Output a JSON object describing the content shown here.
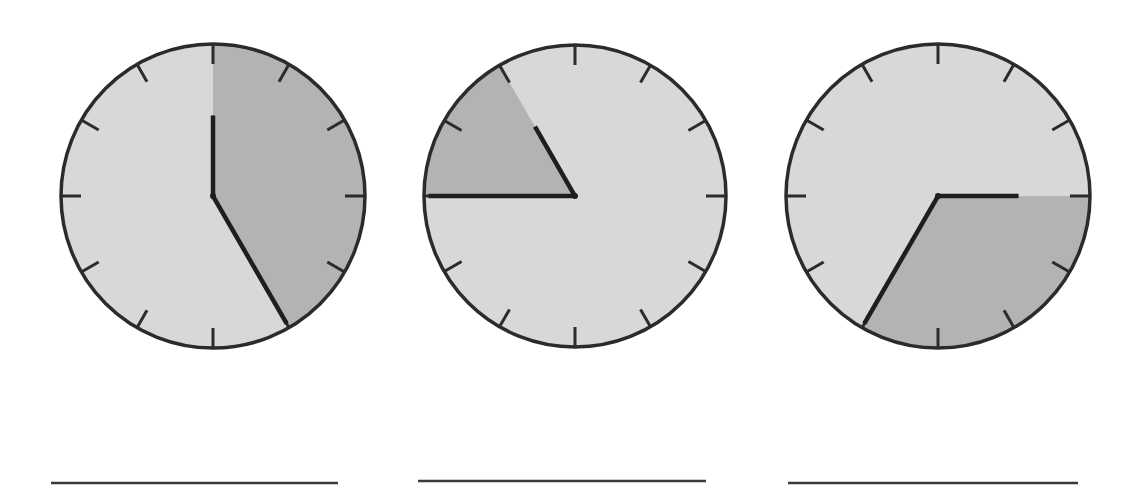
{
  "worksheet": {
    "type": "clock-reading exercise",
    "colors": {
      "face": "#d8d8d8",
      "shaded_sector": "#b3b3b3",
      "outline": "#2b2b2b",
      "hands": "#1e1e1e",
      "answer_line": "#3a3a3a"
    },
    "clocks": [
      {
        "id": "clock-1",
        "cx": 213,
        "cy": 196,
        "r": 152,
        "hour_hand_points_to": 12,
        "minute_hand_points_to": 5,
        "time_shown": "12:25",
        "shaded_from": 12,
        "shaded_to": 5,
        "answer_line": {
          "x1": 51,
          "x2": 338,
          "y": 483
        }
      },
      {
        "id": "clock-2",
        "cx": 575,
        "cy": 196,
        "r": 151,
        "hour_hand_points_to": 11,
        "minute_hand_points_to": 9,
        "time_shown": "10:45",
        "shaded_from": 9,
        "shaded_to": 11,
        "answer_line": {
          "x1": 418,
          "x2": 706,
          "y": 481
        }
      },
      {
        "id": "clock-3",
        "cx": 938,
        "cy": 196,
        "r": 152,
        "hour_hand_points_to": 3,
        "minute_hand_points_to": 7,
        "time_shown": "3:35",
        "shaded_from": 3,
        "shaded_to": 7,
        "answer_line": {
          "x1": 788,
          "x2": 1078,
          "y": 483
        }
      }
    ]
  }
}
